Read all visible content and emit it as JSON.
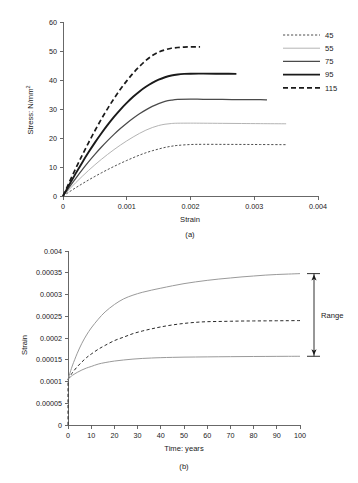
{
  "figure": {
    "panel_a_caption": "(a)",
    "panel_b_caption": "(b)"
  },
  "chart_data": [
    {
      "type": "line",
      "panel": "(a)",
      "title": "",
      "xlabel": "Strain",
      "ylabel": "Stress: N/mm²",
      "xlim": [
        0,
        0.004
      ],
      "ylim": [
        0,
        60
      ],
      "xticks": [
        0,
        0.001,
        0.002,
        0.003,
        0.004
      ],
      "xticklabels": [
        "0",
        "0.001",
        "0.002",
        "0.003",
        "0.004"
      ],
      "yticks": [
        0,
        10,
        20,
        30,
        40,
        50,
        60
      ],
      "yticklabels": [
        "0",
        "10",
        "20",
        "30",
        "40",
        "50",
        "60"
      ],
      "grid": false,
      "legend_position": "right-outside",
      "legend_entries": [
        "45",
        "55",
        "75",
        "95",
        "115"
      ],
      "series": [
        {
          "name": "45",
          "style": "fine-dashed",
          "color": "#3a3a3a",
          "width": 0.9,
          "dash": "2.2,1.8",
          "plateau": 17.6,
          "x": [
            0,
            0.0001,
            0.0002,
            0.0003,
            0.0004,
            0.0005,
            0.0006,
            0.0007,
            0.0008,
            0.0009,
            0.001,
            0.0011,
            0.0012,
            0.0013,
            0.0014,
            0.0015,
            0.0016,
            0.0017,
            0.0018,
            0.002,
            0.0022,
            0.0025,
            0.0028,
            0.0031,
            0.0035
          ],
          "y": [
            0,
            1.45,
            2.85,
            4.2,
            5.5,
            6.75,
            7.95,
            9.1,
            10.2,
            11.25,
            12.25,
            13.2,
            14.1,
            14.9,
            15.6,
            16.2,
            16.75,
            17.15,
            17.45,
            17.75,
            17.82,
            17.8,
            17.78,
            17.75,
            17.7
          ]
        },
        {
          "name": "55",
          "style": "thin-light-solid",
          "color": "#b4b4b4",
          "width": 1.0,
          "dash": "none",
          "plateau": 25.0,
          "x": [
            0,
            0.0001,
            0.0002,
            0.0003,
            0.0004,
            0.0005,
            0.0006,
            0.0007,
            0.0008,
            0.0009,
            0.001,
            0.0011,
            0.0012,
            0.0013,
            0.0014,
            0.0015,
            0.0016,
            0.0017,
            0.0018,
            0.002,
            0.0022,
            0.0025,
            0.0028,
            0.0031,
            0.0035
          ],
          "y": [
            0,
            2.35,
            4.6,
            6.75,
            8.8,
            10.75,
            12.6,
            14.35,
            16.0,
            17.55,
            19.0,
            20.35,
            21.6,
            22.7,
            23.6,
            24.3,
            24.75,
            25.0,
            25.1,
            25.12,
            25.1,
            25.05,
            25.0,
            24.95,
            24.9
          ]
        },
        {
          "name": "75",
          "style": "medium-solid",
          "color": "#4a4a4a",
          "width": 1.25,
          "dash": "none",
          "plateau": 33.1,
          "x": [
            0,
            0.0001,
            0.0002,
            0.0003,
            0.0004,
            0.0005,
            0.0006,
            0.0007,
            0.0008,
            0.0009,
            0.001,
            0.0011,
            0.0012,
            0.0013,
            0.0014,
            0.0015,
            0.0016,
            0.0017,
            0.0018,
            0.002,
            0.0022,
            0.0025,
            0.0028,
            0.0031,
            0.0032
          ],
          "y": [
            0,
            3.1,
            6.1,
            9.0,
            11.75,
            14.35,
            16.8,
            19.1,
            21.25,
            23.25,
            25.1,
            26.8,
            28.35,
            29.7,
            30.9,
            31.85,
            32.6,
            33.05,
            33.3,
            33.4,
            33.35,
            33.3,
            33.25,
            33.2,
            33.15
          ]
        },
        {
          "name": "95",
          "style": "thick-solid",
          "color": "#1a1a1a",
          "width": 1.9,
          "dash": "none",
          "plateau": 42.0,
          "x": [
            0,
            0.0001,
            0.0002,
            0.0003,
            0.0004,
            0.0005,
            0.0006,
            0.0007,
            0.0008,
            0.0009,
            0.001,
            0.0011,
            0.0012,
            0.0013,
            0.0014,
            0.0015,
            0.0016,
            0.0017,
            0.0018,
            0.0019,
            0.002,
            0.0022,
            0.0024,
            0.0026,
            0.00272
          ],
          "y": [
            0,
            3.95,
            7.8,
            11.5,
            15.05,
            18.4,
            21.55,
            24.5,
            27.25,
            29.8,
            32.1,
            34.2,
            36.05,
            37.65,
            39.0,
            40.1,
            40.95,
            41.55,
            41.9,
            42.1,
            42.18,
            42.2,
            42.18,
            42.15,
            42.12
          ]
        },
        {
          "name": "115",
          "style": "thick-dashed",
          "color": "#1a1a1a",
          "width": 1.7,
          "dash": "5,3",
          "plateau": 51.4,
          "x": [
            0,
            0.0001,
            0.0002,
            0.0003,
            0.0004,
            0.0005,
            0.0006,
            0.0007,
            0.0008,
            0.0009,
            0.001,
            0.0011,
            0.0012,
            0.0013,
            0.0014,
            0.0015,
            0.0016,
            0.0017,
            0.0018,
            0.0019,
            0.002,
            0.0021,
            0.00215
          ],
          "y": [
            0,
            4.8,
            9.5,
            14.0,
            18.35,
            22.5,
            26.45,
            30.15,
            33.6,
            36.8,
            39.7,
            42.35,
            44.7,
            46.75,
            48.4,
            49.6,
            50.4,
            50.95,
            51.2,
            51.35,
            51.42,
            51.45,
            51.45
          ]
        }
      ]
    },
    {
      "type": "line",
      "panel": "(b)",
      "title": "",
      "xlabel": "Time: years",
      "ylabel": "Strain",
      "xlim": [
        0,
        100
      ],
      "ylim": [
        0,
        0.0004
      ],
      "xticks": [
        0,
        10,
        20,
        30,
        40,
        50,
        60,
        70,
        80,
        90,
        100
      ],
      "xticklabels": [
        "0",
        "10",
        "20",
        "30",
        "40",
        "50",
        "60",
        "70",
        "80",
        "90",
        "100"
      ],
      "yticks": [
        0,
        5e-05,
        0.0001,
        0.00015,
        0.0002,
        0.00025,
        0.0003,
        0.00035,
        0.0004
      ],
      "yticklabels": [
        "0",
        "0.00005",
        "0.0001",
        "0.00015",
        "0.0002",
        "0.00025",
        "0.0003",
        "0.00035",
        "0.004"
      ],
      "grid": false,
      "legend_position": "none",
      "annotations": [
        {
          "name": "range-annotation",
          "label": "Range",
          "x": 100,
          "y_top": 0.000348,
          "y_bottom": 0.000158
        }
      ],
      "series": [
        {
          "name": "upper",
          "style": "thin-light-solid",
          "color": "#9a9a9a",
          "width": 1.0,
          "dash": "none",
          "x": [
            0,
            1,
            2,
            4,
            6,
            8,
            10,
            13,
            16,
            20,
            24,
            28,
            32,
            36,
            40,
            45,
            50,
            55,
            60,
            65,
            70,
            75,
            80,
            85,
            90,
            95,
            100
          ],
          "y": [
            0.000105,
            0.000122,
            0.000138,
            0.000165,
            0.000188,
            0.000207,
            0.000223,
            0.000243,
            0.00026,
            0.000277,
            0.00029,
            0.0002985,
            0.000305,
            0.00031,
            0.0003145,
            0.00032,
            0.000325,
            0.000329,
            0.0003325,
            0.0003355,
            0.000338,
            0.0003405,
            0.0003425,
            0.0003445,
            0.000346,
            0.000347,
            0.000348
          ]
        },
        {
          "name": "middle",
          "style": "dashed",
          "color": "#2a2a2a",
          "width": 1.0,
          "dash": "3.2,2.4",
          "x": [
            0,
            1,
            2,
            4,
            6,
            8,
            10,
            13,
            16,
            20,
            24,
            28,
            32,
            36,
            40,
            45,
            50,
            55,
            60,
            65,
            70,
            75,
            80,
            85,
            90,
            95,
            100
          ],
          "y": [
            0.000105,
            0.000113,
            0.000121,
            0.000134,
            0.000145,
            0.000155,
            0.000163,
            0.000174,
            0.000183,
            0.000194,
            0.000202,
            0.00021,
            0.000216,
            0.000221,
            0.0002255,
            0.00023,
            0.0002335,
            0.000236,
            0.0002375,
            0.000238,
            0.0002385,
            0.000239,
            0.0002392,
            0.0002394,
            0.0002396,
            0.0002398,
            0.00024
          ]
        },
        {
          "name": "lower",
          "style": "thin-light-solid",
          "color": "#9a9a9a",
          "width": 1.0,
          "dash": "none",
          "x": [
            0,
            1,
            2,
            4,
            6,
            8,
            10,
            13,
            16,
            20,
            24,
            28,
            32,
            36,
            40,
            45,
            50,
            55,
            60,
            65,
            70,
            75,
            80,
            85,
            90,
            95,
            100
          ],
          "y": [
            0.000105,
            0.00011,
            0.0001145,
            0.000121,
            0.0001265,
            0.000131,
            0.0001345,
            0.00014,
            0.0001435,
            0.000147,
            0.0001495,
            0.0001515,
            0.000153,
            0.000154,
            0.0001548,
            0.0001555,
            0.000156,
            0.0001563,
            0.0001566,
            0.0001569,
            0.0001571,
            0.0001573,
            0.0001575,
            0.0001576,
            0.0001578,
            0.0001579,
            0.000158
          ]
        }
      ],
      "origin_drop": {
        "name": "origin-drop-line",
        "style": "dashed",
        "color": "#2a2a2a",
        "x": 0,
        "y_from": 0,
        "y_to": 0.000105
      }
    }
  ]
}
